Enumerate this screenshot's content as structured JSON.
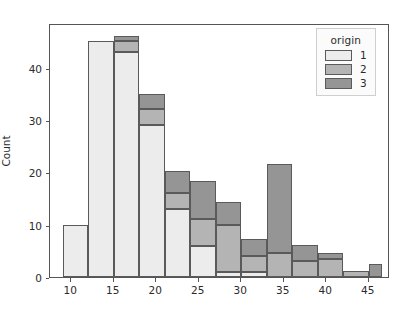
{
  "chart_data": {
    "type": "bar",
    "subtype": "stacked-histogram",
    "title": "",
    "xlabel": "",
    "ylabel": "Count",
    "xlim": [
      7.5,
      47.5
    ],
    "ylim": [
      0,
      48.5
    ],
    "grid": false,
    "bin_width": 3,
    "bin_edges": [
      9,
      12,
      15,
      18,
      21,
      24,
      27,
      30,
      33,
      36,
      39,
      42,
      45,
      46.5
    ],
    "xticks": [
      10,
      15,
      20,
      25,
      30,
      35,
      40,
      45
    ],
    "yticks": [
      0,
      10,
      20,
      30,
      40
    ],
    "legend": {
      "title": "origin",
      "position": "upper right",
      "entries": [
        {
          "label": "1",
          "color": "#ececec"
        },
        {
          "label": "2",
          "color": "#b4b4b4"
        },
        {
          "label": "3",
          "color": "#959595"
        }
      ]
    },
    "series": [
      {
        "name": "1",
        "color": "#ececec",
        "values": [
          10,
          45,
          43,
          29,
          13,
          6,
          1,
          1,
          0,
          0,
          0,
          0,
          0
        ]
      },
      {
        "name": "2",
        "color": "#b4b4b4",
        "values": [
          0,
          0,
          2,
          3,
          3,
          5,
          9,
          3,
          4.5,
          3,
          3.5,
          1.2,
          0
        ]
      },
      {
        "name": "3",
        "color": "#959595",
        "values": [
          0,
          0,
          1,
          3,
          4.3,
          7.3,
          4.3,
          3.3,
          17,
          3.2,
          1,
          0,
          2.5
        ]
      }
    ],
    "bin_totals": [
      10,
      45,
      46,
      35,
      20.3,
      18.3,
      14.3,
      7.3,
      21.5,
      6.2,
      4.5,
      1.2,
      2.5
    ]
  },
  "axes": {
    "ylabel": "Count",
    "ytick_labels": [
      "0",
      "10",
      "20",
      "30",
      "40"
    ],
    "xtick_labels": [
      "10",
      "15",
      "20",
      "25",
      "30",
      "35",
      "40",
      "45"
    ]
  },
  "legend": {
    "title": "origin",
    "items": [
      {
        "label": "1"
      },
      {
        "label": "2"
      },
      {
        "label": "3"
      }
    ]
  },
  "style": {
    "origin1_color": "#ececec",
    "origin2_color": "#b4b4b4",
    "origin3_color": "#959595",
    "edge_color": "#5a5a5a",
    "axis_color": "#555555",
    "text_color": "#2b2b2b",
    "background": "#ffffff"
  }
}
